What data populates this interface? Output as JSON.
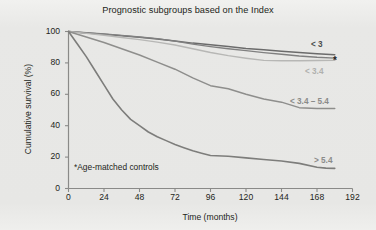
{
  "figure": {
    "title": "Prognostic subgroups based on the Index",
    "footnote": "*Age-matched controls",
    "star_marker": "*",
    "background_color": "#e9e9e7",
    "axis_color": "#8a8a88",
    "text_color": "#231f20"
  },
  "chart_data": {
    "type": "line",
    "title": "Prognostic subgroups based on the Index",
    "xlabel": "Time (months)",
    "ylabel": "Cumulative survival (%)",
    "xlim": [
      0,
      192
    ],
    "ylim": [
      0,
      100
    ],
    "xticks": [
      0,
      24,
      48,
      72,
      96,
      120,
      144,
      168,
      192
    ],
    "yticks": [
      0,
      20,
      40,
      60,
      80,
      100
    ],
    "grid": false,
    "legend_position": "right-inline",
    "annotations": [
      "*Age-matched controls"
    ],
    "series": [
      {
        "name": "< 3",
        "label": "< 3",
        "color": "#6b6b6b",
        "width": 1.5,
        "x": [
          0,
          12,
          24,
          36,
          48,
          60,
          72,
          84,
          96,
          108,
          120,
          132,
          144,
          156,
          168,
          180
        ],
        "y": [
          100,
          99,
          98.2,
          97.3,
          96.4,
          95.2,
          94.0,
          92.6,
          91.5,
          90.4,
          89.2,
          88.4,
          87.5,
          86.6,
          85.8,
          85.2
        ]
      },
      {
        "name": "Age-matched controls",
        "label": "*",
        "color": "#808080",
        "width": 1.3,
        "x": [
          0,
          12,
          24,
          36,
          48,
          60,
          72,
          84,
          96,
          108,
          120,
          132,
          144,
          156,
          168,
          180
        ],
        "y": [
          100,
          99.2,
          98.4,
          97.5,
          96.5,
          95.4,
          93.8,
          92.0,
          90.4,
          89.0,
          87.8,
          86.6,
          85.5,
          84.4,
          83.6,
          83.1
        ]
      },
      {
        "name": "< 3.4",
        "label": "< 3.4",
        "color": "#b7b7b5",
        "width": 1.4,
        "x": [
          0,
          12,
          24,
          36,
          48,
          60,
          72,
          84,
          96,
          108,
          120,
          132,
          144,
          156,
          168,
          180
        ],
        "y": [
          100,
          98.8,
          97.6,
          96.2,
          94.8,
          93.2,
          91.4,
          89.0,
          86.6,
          84.6,
          83.0,
          81.6,
          81.4,
          81.4,
          81.5,
          81.6
        ]
      },
      {
        "name": "< 3.4 - 5.4",
        "label": "< 3.4 – 5.4",
        "color": "#8e8e8c",
        "width": 1.5,
        "x": [
          0,
          12,
          24,
          36,
          48,
          60,
          72,
          84,
          96,
          108,
          120,
          132,
          144,
          156,
          168,
          180
        ],
        "y": [
          100,
          96.5,
          93.0,
          89.0,
          85.0,
          80.5,
          76.0,
          70.5,
          65.5,
          63.5,
          60.0,
          57.0,
          55.0,
          51.5,
          51.0,
          51.0
        ]
      },
      {
        "name": "> 5.4",
        "label": "> 5.4",
        "color": "#7d7d7b",
        "width": 1.6,
        "x": [
          0,
          6,
          12,
          18,
          24,
          30,
          36,
          42,
          48,
          54,
          60,
          66,
          72,
          78,
          84,
          90,
          96,
          108,
          120,
          132,
          144,
          156,
          168,
          174,
          180
        ],
        "y": [
          100,
          92,
          84,
          75,
          66,
          57,
          50,
          44,
          40,
          36,
          33,
          30.5,
          28,
          26,
          24,
          22.5,
          21,
          20.5,
          19.5,
          18.5,
          17.5,
          16,
          13.5,
          13,
          12.8
        ]
      }
    ]
  },
  "series_labels": [
    {
      "text": "< 3",
      "x": 311,
      "y": 40,
      "color": "#4d4d4d",
      "bold": true
    },
    {
      "text": "*",
      "x": 333,
      "y": 55,
      "color": "#231f20",
      "bold": true
    },
    {
      "text": "< 3.4",
      "x": 305,
      "y": 67,
      "color": "#b0b0ae",
      "bold": true
    },
    {
      "text": "< 3.4 – 5.4",
      "x": 290,
      "y": 97,
      "color": "#8b8b89",
      "bold": true
    },
    {
      "text": "> 5.4",
      "x": 314,
      "y": 156,
      "color": "#8b8b89",
      "bold": true
    }
  ]
}
